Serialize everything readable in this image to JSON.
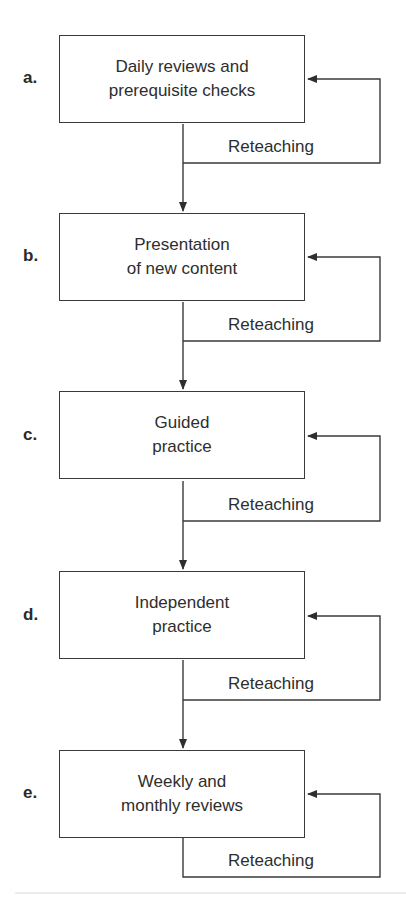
{
  "diagram": {
    "type": "flowchart",
    "steps": [
      {
        "label": "a.",
        "line1": "Daily reviews and",
        "line2": "prerequisite checks",
        "loop_label": "Reteaching"
      },
      {
        "label": "b.",
        "line1": "Presentation",
        "line2": "of new content",
        "loop_label": "Reteaching"
      },
      {
        "label": "c.",
        "line1": "Guided",
        "line2": "practice",
        "loop_label": "Reteaching"
      },
      {
        "label": "d.",
        "line1": "Independent",
        "line2": "practice",
        "loop_label": "Reteaching"
      },
      {
        "label": "e.",
        "line1": "Weekly and",
        "line2": "monthly reviews",
        "loop_label": "Reteaching"
      }
    ],
    "colors": {
      "line": "#3a3a3a",
      "text": "#2e2e2e",
      "background": "#ffffff"
    }
  }
}
